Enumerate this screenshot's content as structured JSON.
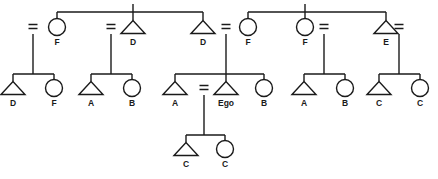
{
  "diagram": {
    "type": "kinship-chart",
    "title": "",
    "colors": {
      "line": "#1a1a1a",
      "background": "#ffffff",
      "label": "#1a1a1a"
    },
    "symbols": {
      "male": "triangle",
      "female": "circle",
      "marriage": "equals-sign",
      "descent": "vertical-line",
      "sibling": "horizontal-bar"
    },
    "generations": [
      {
        "id": "gen1",
        "name": "grandparent-generation",
        "sibling_groups": [
          {
            "id": "g1-left",
            "bar_x1": 57,
            "bar_x2": 203,
            "bar_y": 12,
            "stem_x": 133,
            "members": [
              {
                "id": "g1-f1",
                "sex": "female",
                "label": "F",
                "cx": 57,
                "cy": 27,
                "spouse_side": "left",
                "marriage_x": 34,
                "descent_to": "fam1"
              },
              {
                "id": "g1-d1",
                "sex": "male",
                "label": "D",
                "cx": 133,
                "cy": 27,
                "spouse_side": "left",
                "marriage_x": 111,
                "descent_to": "fam2"
              },
              {
                "id": "g1-d2",
                "sex": "male",
                "label": "D",
                "cx": 203,
                "cy": 27,
                "spouse_side": "right",
                "marriage_x": 226,
                "descent_to": "fam3"
              }
            ]
          },
          {
            "id": "g1-right",
            "bar_x1": 248,
            "bar_x2": 386,
            "bar_y": 12,
            "stem_x": 305,
            "members": [
              {
                "id": "g1-f2",
                "sex": "female",
                "label": "F",
                "cx": 248,
                "cy": 27,
                "spouse_side": "left",
                "marriage_x": 226,
                "descent_to": "fam3"
              },
              {
                "id": "g1-f3",
                "sex": "female",
                "label": "F",
                "cx": 305,
                "cy": 27,
                "spouse_side": "right",
                "marriage_x": 324,
                "descent_to": "fam4"
              },
              {
                "id": "g1-e1",
                "sex": "male",
                "label": "E",
                "cx": 386,
                "cy": 27,
                "spouse_side": "right",
                "marriage_x": 399,
                "descent_to": "fam5"
              }
            ]
          }
        ]
      },
      {
        "id": "gen2",
        "name": "ego-generation",
        "families": [
          {
            "id": "fam1",
            "stem_x": 33,
            "stem_y1": 34,
            "bar_y": 74,
            "bar_x1": 13,
            "bar_x2": 54,
            "children": [
              {
                "id": "f1-c1",
                "sex": "male",
                "label": "D",
                "cx": 13,
                "cy": 88
              },
              {
                "id": "f1-c2",
                "sex": "female",
                "label": "F",
                "cx": 54,
                "cy": 88
              }
            ]
          },
          {
            "id": "fam2",
            "stem_x": 111,
            "stem_y1": 34,
            "bar_y": 74,
            "bar_x1": 91,
            "bar_x2": 132,
            "children": [
              {
                "id": "f2-c1",
                "sex": "male",
                "label": "A",
                "cx": 91,
                "cy": 88
              },
              {
                "id": "f2-c2",
                "sex": "female",
                "label": "B",
                "cx": 132,
                "cy": 88
              }
            ]
          },
          {
            "id": "fam3",
            "stem_x": 226,
            "stem_y1": 34,
            "bar_y": 74,
            "bar_x1": 175,
            "bar_x2": 264,
            "children": [
              {
                "id": "f3-c1",
                "sex": "male",
                "label": "A",
                "cx": 175,
                "cy": 88
              },
              {
                "id": "f3-ego",
                "sex": "male",
                "label": "Ego",
                "cx": 226,
                "cy": 88,
                "is_ego": true,
                "spouse_side": "left",
                "marriage_x": 204,
                "descent_to": "fam6"
              },
              {
                "id": "f3-c3",
                "sex": "female",
                "label": "B",
                "cx": 264,
                "cy": 88
              }
            ]
          },
          {
            "id": "fam4",
            "stem_x": 324,
            "stem_y1": 34,
            "bar_y": 74,
            "bar_x1": 304,
            "bar_x2": 345,
            "children": [
              {
                "id": "f4-c1",
                "sex": "male",
                "label": "A",
                "cx": 304,
                "cy": 88
              },
              {
                "id": "f4-c2",
                "sex": "female",
                "label": "B",
                "cx": 345,
                "cy": 88
              }
            ]
          },
          {
            "id": "fam5",
            "stem_x": 399,
            "stem_y1": 34,
            "bar_y": 74,
            "bar_x1": 379,
            "bar_x2": 420,
            "children": [
              {
                "id": "f5-c1",
                "sex": "male",
                "label": "C",
                "cx": 379,
                "cy": 88
              },
              {
                "id": "f5-c2",
                "sex": "female",
                "label": "C",
                "cx": 420,
                "cy": 88
              }
            ]
          }
        ]
      },
      {
        "id": "gen3",
        "name": "children-generation",
        "families": [
          {
            "id": "fam6",
            "stem_x": 204,
            "stem_y1": 95,
            "bar_y": 135,
            "bar_x1": 186,
            "bar_x2": 225,
            "children": [
              {
                "id": "f6-c1",
                "sex": "male",
                "label": "C",
                "cx": 186,
                "cy": 149
              },
              {
                "id": "f6-c2",
                "sex": "female",
                "label": "C",
                "cx": 225,
                "cy": 149
              }
            ]
          }
        ]
      }
    ],
    "labels_in_order": [
      "F",
      "D",
      "D",
      "F",
      "F",
      "E",
      "D",
      "F",
      "A",
      "B",
      "A",
      "Ego",
      "B",
      "A",
      "B",
      "C",
      "C",
      "C",
      "C"
    ],
    "ego_label": "Ego"
  }
}
